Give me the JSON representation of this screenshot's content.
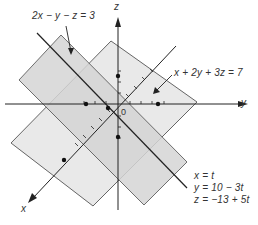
{
  "diagram": {
    "axes": {
      "x_label": "x",
      "y_label": "y",
      "z_label": "z",
      "origin_label": "0"
    },
    "planes": [
      {
        "equation": "2x − y − z = 3",
        "fill": "#d6d6d6"
      },
      {
        "equation": "x + 2y + 3z = 7",
        "fill": "#e6e6e6"
      }
    ],
    "line_of_intersection": {
      "eq_x": "x = t",
      "eq_y": "y = 10 − 3t",
      "eq_z": "z = −13 + 5t"
    },
    "colors": {
      "stroke": "#333333",
      "plane_dark": "#d2d2d2",
      "plane_light": "#e8e8e8",
      "overlap": "#c6c6c6"
    }
  }
}
